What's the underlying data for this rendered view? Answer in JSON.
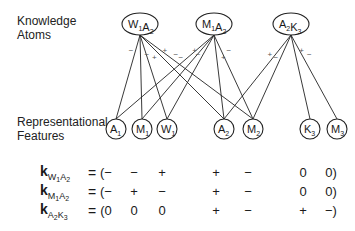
{
  "labels": {
    "knowledge_atoms_line1": "Knowledge",
    "knowledge_atoms_line2": "Atoms",
    "features_line1": "Representational",
    "features_line2": "Features"
  },
  "atoms": [
    {
      "id": "W1A2",
      "parts": [
        [
          "W",
          "1"
        ],
        [
          "A",
          "2"
        ]
      ]
    },
    {
      "id": "M1A2",
      "parts": [
        [
          "M",
          "1"
        ],
        [
          "A",
          "2"
        ]
      ]
    },
    {
      "id": "A2K3",
      "parts": [
        [
          "A",
          "2"
        ],
        [
          "K",
          "3"
        ]
      ]
    }
  ],
  "features": [
    {
      "id": "A1",
      "letter": "A",
      "sub": "1"
    },
    {
      "id": "M1",
      "letter": "M",
      "sub": "1"
    },
    {
      "id": "W1",
      "letter": "W",
      "sub": "1"
    },
    {
      "id": "A2",
      "letter": "A",
      "sub": "2"
    },
    {
      "id": "M2",
      "letter": "M",
      "sub": "2"
    },
    {
      "id": "K3",
      "letter": "K",
      "sub": "3"
    },
    {
      "id": "M3",
      "letter": "M",
      "sub": "3"
    }
  ],
  "connections": [
    {
      "from": "W1A2",
      "to": "A1",
      "sign": "−"
    },
    {
      "from": "W1A2",
      "to": "M1",
      "sign": "−"
    },
    {
      "from": "W1A2",
      "to": "W1",
      "sign": "+"
    },
    {
      "from": "W1A2",
      "to": "A2",
      "sign": "+"
    },
    {
      "from": "W1A2",
      "to": "M2",
      "sign": "−"
    },
    {
      "from": "M1A2",
      "to": "A1",
      "sign": "−"
    },
    {
      "from": "M1A2",
      "to": "M1",
      "sign": "+"
    },
    {
      "from": "M1A2",
      "to": "W1",
      "sign": "−"
    },
    {
      "from": "M1A2",
      "to": "A2",
      "sign": "+"
    },
    {
      "from": "M1A2",
      "to": "M2",
      "sign": "−"
    },
    {
      "from": "A2K3",
      "to": "A2",
      "sign": "+"
    },
    {
      "from": "A2K3",
      "to": "M2",
      "sign": "−"
    },
    {
      "from": "A2K3",
      "to": "K3",
      "sign": "+"
    },
    {
      "from": "A2K3",
      "to": "M3",
      "sign": "−"
    }
  ],
  "vectors": [
    {
      "name": "k",
      "sub": [
        [
          "W",
          "1"
        ],
        [
          "A",
          "2"
        ]
      ],
      "equals": "=",
      "values": [
        "(−",
        "−",
        "+",
        "+",
        "−",
        "0",
        "0)"
      ]
    },
    {
      "name": "k",
      "sub": [
        [
          "M",
          "1"
        ],
        [
          "A",
          "2"
        ]
      ],
      "equals": "=",
      "values": [
        "(−",
        "+",
        "−",
        "+",
        "−",
        "0",
        "0)"
      ]
    },
    {
      "name": "k",
      "sub": [
        [
          "A",
          "2"
        ],
        [
          "K",
          "3"
        ]
      ],
      "equals": "=",
      "values": [
        "(0",
        "0",
        "0",
        "+",
        "−",
        "+",
        "−)"
      ]
    }
  ]
}
